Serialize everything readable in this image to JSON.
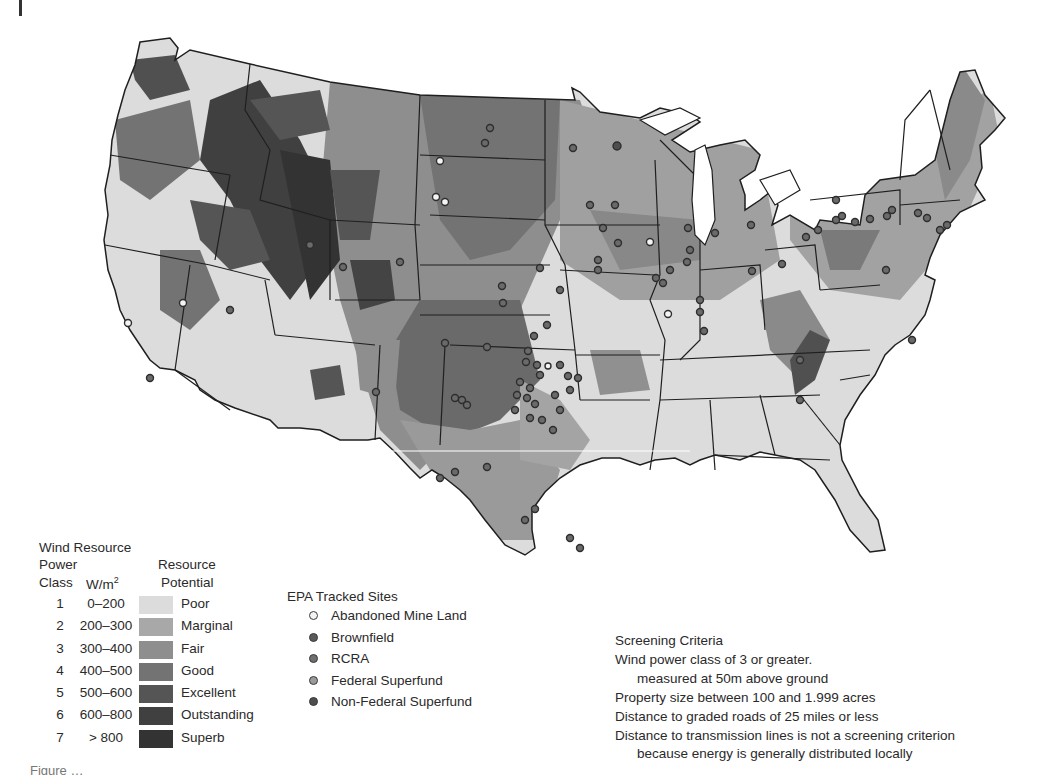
{
  "figure": {
    "type": "map",
    "region": "Contiguous United States",
    "caption_visible": "Figure (caption cut off at bottom edge)"
  },
  "colors": {
    "class_1": "#dcdcdc",
    "class_2": "#a8a8a8",
    "class_3": "#8e8e8e",
    "class_4": "#737373",
    "class_5": "#555555",
    "class_6": "#404040",
    "class_7": "#333333",
    "state_border": "#1f1f1f",
    "water": "#ffffff"
  },
  "wind_legend": {
    "title": "Wind Resource",
    "header_power": "Power",
    "header_class": "Class",
    "header_wm2": "W/m",
    "header_wm2_sup": "2",
    "header_resource": "Resource",
    "header_potential": "Potential",
    "rows": [
      {
        "class": "1",
        "range": "0–200",
        "label": "Poor",
        "color": "#dcdcdc"
      },
      {
        "class": "2",
        "range": "200–300",
        "label": "Marginal",
        "color": "#a8a8a8"
      },
      {
        "class": "3",
        "range": "300–400",
        "label": "Fair",
        "color": "#8e8e8e"
      },
      {
        "class": "4",
        "range": "400–500",
        "label": "Good",
        "color": "#737373"
      },
      {
        "class": "5",
        "range": "500–600",
        "label": "Excellent",
        "color": "#555555"
      },
      {
        "class": "6",
        "range": "600–800",
        "label": "Outstanding",
        "color": "#404040"
      },
      {
        "class": "7",
        "range": "> 800",
        "label": "Superb",
        "color": "#333333"
      }
    ]
  },
  "epa_legend": {
    "title": "EPA Tracked Sites",
    "items": [
      {
        "label": "Abandoned Mine Land",
        "fill": "#f4f4f4"
      },
      {
        "label": "Brownfield",
        "fill": "#5a5a5a"
      },
      {
        "label": "RCRA",
        "fill": "#6e6e6e"
      },
      {
        "label": "Federal Superfund",
        "fill": "#9a9a9a"
      },
      {
        "label": "Non-Federal Superfund",
        "fill": "#4e4e4e"
      }
    ]
  },
  "screening_criteria": {
    "title": "Screening Criteria",
    "lines": [
      {
        "text": "Wind power class of 3 or greater.",
        "indent": false
      },
      {
        "text": "measured at 50m above ground",
        "indent": true
      },
      {
        "text": "Property size between 100 and 1.999 acres",
        "indent": false
      },
      {
        "text": "Distance to graded roads of 25 miles or less",
        "indent": false
      },
      {
        "text": "Distance to transmission lines is not a screening criterion",
        "indent": false
      },
      {
        "text": "because energy is generally distributed locally",
        "indent": true
      }
    ]
  },
  "caption": {
    "text": "Figure …"
  }
}
